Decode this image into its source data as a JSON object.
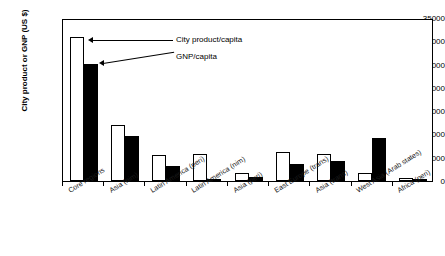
{
  "chart_data": {
    "type": "bar",
    "title": "",
    "xlabel": "",
    "ylabel": "City product or GNP (US $)",
    "ylim": [
      0,
      35000
    ],
    "ytick_labels": [
      "35000",
      "30000",
      "25000",
      "20000",
      "15000",
      "10000",
      "5000",
      "0"
    ],
    "ytick_values": [
      35000,
      30000,
      25000,
      20000,
      15000,
      10000,
      5000,
      0
    ],
    "grid": false,
    "legend_position": "inline-annotations",
    "categories": [
      "Core regions",
      "Asia (nim)",
      "Latin America (peri)",
      "Latin America (nim)",
      "Asia (peri)",
      "East Europe (trans)",
      "Asia (trans)",
      "West Asia (Arab states)",
      "Africa (peri)"
    ],
    "series": [
      {
        "name": "City product/capita",
        "color": "#ffffff",
        "values": [
          31000,
          12000,
          5500,
          5800,
          1800,
          6300,
          5900,
          1700,
          700
        ]
      },
      {
        "name": "GNP/capita",
        "color": "#000000",
        "values": [
          25200,
          9700,
          3200,
          300,
          800,
          3700,
          4400,
          9300,
          300
        ]
      }
    ],
    "annotations": [
      {
        "label": "City product/capita",
        "target_series": "City product/capita"
      },
      {
        "label": "GNP/capita",
        "target_series": "GNP/capita"
      }
    ]
  }
}
